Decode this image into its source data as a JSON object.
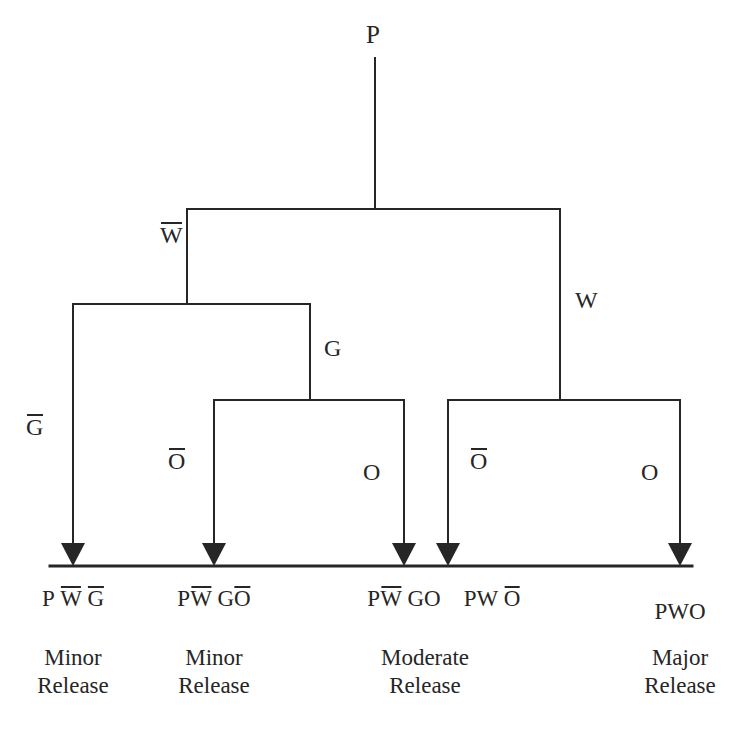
{
  "diagram": {
    "type": "event-tree",
    "title_visible": false,
    "line_color": "#262626",
    "background_color": "#ffffff",
    "root": {
      "label": "P",
      "name": "root-node-p"
    },
    "branch_labels": [
      {
        "id": "w-bar",
        "text": "W",
        "overbar": true,
        "x": 162,
        "y": 226
      },
      {
        "id": "w",
        "text": "W",
        "overbar": false,
        "x": 575,
        "y": 290
      },
      {
        "id": "g-bar",
        "text": "G",
        "overbar": true,
        "x": 26,
        "y": 418
      },
      {
        "id": "g",
        "text": "G",
        "overbar": false,
        "x": 325,
        "y": 338
      },
      {
        "id": "o-bar-1",
        "text": "O",
        "overbar": true,
        "x": 167,
        "y": 450
      },
      {
        "id": "o-1",
        "text": "O",
        "overbar": false,
        "x": 362,
        "y": 462
      },
      {
        "id": "o-bar-2",
        "text": "O",
        "overbar": true,
        "x": 470,
        "y": 450
      },
      {
        "id": "o-2",
        "text": "O",
        "overbar": false,
        "x": 640,
        "y": 462
      }
    ],
    "outcomes": [
      {
        "id": "outcome-1",
        "x": 73,
        "tokens": [
          {
            "text": "P",
            "overbar": false
          },
          {
            "text": "W",
            "overbar": true
          },
          {
            "text": "G",
            "overbar": true
          }
        ],
        "plain": "P W G",
        "release_line1": "Minor",
        "release_line2": "Release"
      },
      {
        "id": "outcome-2",
        "x": 214,
        "tokens": [
          {
            "text": "P",
            "overbar": false
          },
          {
            "text": "W",
            "overbar": true
          },
          {
            "text": "G",
            "overbar": false
          },
          {
            "text": "O",
            "overbar": true
          }
        ],
        "plain": "P W G O",
        "release_line1": "Minor",
        "release_line2": "Release"
      },
      {
        "id": "outcome-3",
        "x": 404,
        "tokens": [
          {
            "text": "P",
            "overbar": false
          },
          {
            "text": "W",
            "overbar": true
          },
          {
            "text": "GO",
            "overbar": false
          }
        ],
        "plain": "P W GO",
        "release_line1": "Moderate",
        "release_line2": "Release"
      },
      {
        "id": "outcome-4",
        "x": 492,
        "tokens": [
          {
            "text": "PW",
            "overbar": false
          },
          {
            "text": "O",
            "overbar": true
          }
        ],
        "plain": "PW O",
        "release_line1": "",
        "release_line2": ""
      },
      {
        "id": "outcome-5",
        "x": 680,
        "tokens": [
          {
            "text": "PWO",
            "overbar": false
          }
        ],
        "plain": "PWO",
        "release_line1": "Major",
        "release_line2": "Release"
      }
    ],
    "release_labels": [
      {
        "id": "release-1",
        "x": 73,
        "line1": "Minor",
        "line2": "Release"
      },
      {
        "id": "release-2",
        "x": 214,
        "line1": "Minor",
        "line2": "Release"
      },
      {
        "id": "release-3",
        "x": 425,
        "line1": "Moderate",
        "line2": "Release"
      },
      {
        "id": "release-4",
        "x": 680,
        "line1": "Major",
        "line2": "Release"
      }
    ],
    "arrow_positions": [
      73,
      214,
      404,
      448,
      680
    ],
    "baseline": {
      "x1": 50,
      "x2": 692,
      "y": 566
    }
  }
}
